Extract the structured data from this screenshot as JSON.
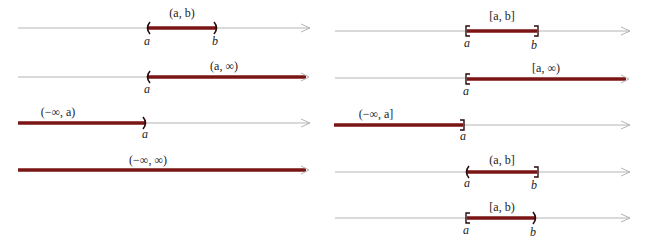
{
  "figure": {
    "colors": {
      "axis": "#b4b4b4",
      "interval": "#7a1515",
      "text": "#222222"
    }
  },
  "left_column": [
    {
      "notation": "(a, b)",
      "endpoints": [
        "a",
        "b"
      ],
      "left": "open",
      "right": "open"
    },
    {
      "notation": "(a, ∞)",
      "endpoints": [
        "a"
      ],
      "left": "open",
      "right": "infinite"
    },
    {
      "notation": "(−∞, a)",
      "endpoints": [
        "a"
      ],
      "left": "infinite",
      "right": "open"
    },
    {
      "notation": "(−∞, ∞)",
      "endpoints": [],
      "left": "infinite",
      "right": "infinite"
    }
  ],
  "right_column": [
    {
      "notation": "[a, b]",
      "endpoints": [
        "a",
        "b"
      ],
      "left": "closed",
      "right": "closed"
    },
    {
      "notation": "[a, ∞)",
      "endpoints": [
        "a"
      ],
      "left": "closed",
      "right": "infinite"
    },
    {
      "notation": "(−∞, a]",
      "endpoints": [
        "a"
      ],
      "left": "infinite",
      "right": "closed"
    },
    {
      "notation": "(a, b]",
      "endpoints": [
        "a",
        "b"
      ],
      "left": "open",
      "right": "closed"
    },
    {
      "notation": "[a, b)",
      "endpoints": [
        "a",
        "b"
      ],
      "left": "closed",
      "right": "open"
    }
  ]
}
